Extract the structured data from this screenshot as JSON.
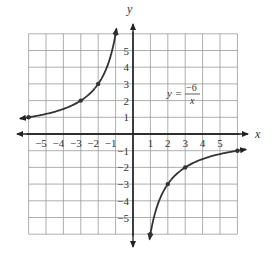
{
  "chart_data": {
    "type": "line",
    "title": "",
    "xlabel": "x",
    "ylabel": "y",
    "xlim": [
      -6,
      6
    ],
    "ylim": [
      -6,
      6
    ],
    "grid": true,
    "x_ticks": [
      -5,
      -4,
      -3,
      -2,
      -1,
      1,
      2,
      3,
      4,
      5
    ],
    "y_ticks": [
      -5,
      -4,
      -3,
      -2,
      -1,
      1,
      2,
      3,
      4,
      5
    ],
    "x_tick_labels": [
      "−5",
      "−4",
      "−3",
      "−2",
      "−1",
      "1",
      "2",
      "3",
      "4",
      "5"
    ],
    "y_tick_labels": [
      "−5",
      "−4",
      "−3",
      "−2",
      "−1",
      "1",
      "2",
      "3",
      "4",
      "5"
    ],
    "annotation": {
      "lhs": "y =",
      "numerator": "−6",
      "denominator": "x",
      "position": [
        2.2,
        3.0
      ]
    },
    "series": [
      {
        "name": "y = -6/x (x<0)",
        "x": [
          -6,
          -3,
          -2,
          -1
        ],
        "y": [
          1,
          2,
          3,
          6
        ],
        "marked_points": [
          [
            -6,
            1
          ],
          [
            -3,
            2
          ],
          [
            -2,
            3
          ],
          [
            -1,
            6
          ]
        ]
      },
      {
        "name": "y = -6/x (x>0)",
        "x": [
          1,
          2,
          3,
          6
        ],
        "y": [
          -6,
          -3,
          -2,
          -1
        ],
        "marked_points": [
          [
            1,
            -6
          ],
          [
            2,
            -3
          ],
          [
            3,
            -2
          ],
          [
            6,
            -1
          ]
        ]
      }
    ]
  },
  "labels": {
    "x_axis": "x",
    "y_axis": "y",
    "eq_lhs": "y =",
    "eq_num": "−6",
    "eq_den": "x"
  },
  "colors": {
    "grid": "#9a9a9a",
    "axis": "#222222",
    "curve": "#333333"
  }
}
